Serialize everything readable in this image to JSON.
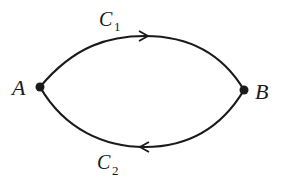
{
  "diagram": {
    "nodes": [
      {
        "id": "A",
        "label": "A"
      },
      {
        "id": "B",
        "label": "B"
      }
    ],
    "curves": [
      {
        "id": "C1",
        "label_main": "C",
        "label_sub": "1",
        "from": "A",
        "to": "B",
        "direction": "A to B (upper arc)"
      },
      {
        "id": "C2",
        "label_main": "C",
        "label_sub": "2",
        "from": "B",
        "to": "A",
        "direction": "B to A (lower arc)"
      }
    ],
    "colors": {
      "stroke": "#1a1a1a",
      "background": "#ffffff"
    }
  }
}
